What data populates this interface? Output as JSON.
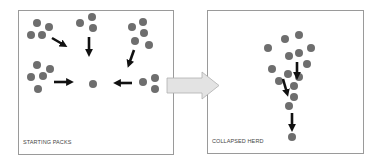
{
  "panels": [
    {
      "id": "starting",
      "label": "STARTING PACKS"
    },
    {
      "id": "collapsed",
      "label": "COLLAPSED HERD"
    }
  ],
  "transition_arrow": {
    "icon": "right-arrow-icon",
    "color": "#e3e3e3",
    "stroke": "#b0b0b0"
  },
  "colors": {
    "dot": "#6e6e6e",
    "arrow": "#111111",
    "border": "#9a9a9a"
  },
  "starting_packs": {
    "groups": [
      {
        "name": "top-left-pack",
        "dots": [
          [
            37,
            23
          ],
          [
            49,
            27
          ],
          [
            31,
            35
          ],
          [
            42,
            35
          ]
        ]
      },
      {
        "name": "top-center-pack",
        "dots": [
          [
            80,
            23
          ],
          [
            92,
            17
          ],
          [
            93,
            28
          ]
        ]
      },
      {
        "name": "top-right-pack",
        "dots": [
          [
            132,
            27
          ],
          [
            143,
            22
          ],
          [
            144,
            33
          ],
          [
            135,
            41
          ],
          [
            149,
            45
          ]
        ]
      },
      {
        "name": "middle-left-pack",
        "dots": [
          [
            37,
            65
          ],
          [
            50,
            69
          ],
          [
            31,
            77
          ],
          [
            43,
            76
          ],
          [
            38,
            89
          ]
        ]
      },
      {
        "name": "center-dot",
        "dots": [
          [
            93,
            84
          ]
        ]
      },
      {
        "name": "right-pack",
        "dots": [
          [
            143,
            82
          ],
          [
            155,
            78
          ],
          [
            155,
            89
          ]
        ]
      }
    ],
    "arrows": [
      {
        "name": "arrow-top-left",
        "from": [
          52,
          38
        ],
        "to": [
          64,
          45
        ]
      },
      {
        "name": "arrow-top-center",
        "from": [
          89,
          37
        ],
        "to": [
          89,
          53
        ]
      },
      {
        "name": "arrow-top-right",
        "from": [
          134,
          50
        ],
        "to": [
          129,
          64
        ]
      },
      {
        "name": "arrow-middle-left",
        "from": [
          54,
          82
        ],
        "to": [
          70,
          82
        ]
      },
      {
        "name": "arrow-right",
        "from": [
          132,
          83
        ],
        "to": [
          117,
          83
        ]
      }
    ]
  },
  "collapsed_herd": {
    "dots": [
      [
        268,
        48
      ],
      [
        285,
        39
      ],
      [
        299,
        35
      ],
      [
        311,
        48
      ],
      [
        289,
        56
      ],
      [
        299,
        53
      ],
      [
        307,
        64
      ],
      [
        272,
        69
      ],
      [
        288,
        74
      ],
      [
        299,
        77
      ],
      [
        279,
        81
      ],
      [
        294,
        86
      ],
      [
        294,
        97
      ],
      [
        289,
        106
      ],
      [
        292,
        137
      ]
    ],
    "arrows": [
      {
        "name": "arrow-upper",
        "from": [
          297,
          62
        ],
        "to": [
          297,
          76
        ]
      },
      {
        "name": "arrow-middle",
        "from": [
          283,
          79
        ],
        "to": [
          287,
          93
        ]
      },
      {
        "name": "arrow-lower",
        "from": [
          292,
          113
        ],
        "to": [
          292,
          128
        ]
      }
    ]
  }
}
